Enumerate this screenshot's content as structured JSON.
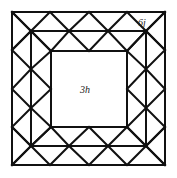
{
  "diagram": {
    "labels": {
      "center": "3h",
      "corner": "6j"
    },
    "colors": {
      "stroke": "#111111",
      "background": "#ffffff",
      "text": "#222222"
    },
    "geometry": {
      "outer_square": [
        12,
        12,
        165,
        165
      ],
      "middle_square": [
        31,
        31,
        146,
        146
      ],
      "inner_square": [
        51,
        51,
        127,
        127
      ]
    }
  }
}
